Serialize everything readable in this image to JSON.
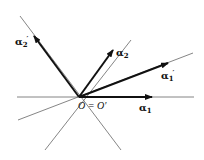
{
  "diagram": {
    "origin_label": "O = O′",
    "vectors": [
      {
        "name": "alpha1",
        "label": "α",
        "sub": "1",
        "prime": ""
      },
      {
        "name": "alpha2",
        "label": "α",
        "sub": "2",
        "prime": ""
      },
      {
        "name": "alpha1-prime",
        "label": "α",
        "sub": "1",
        "prime": "′"
      },
      {
        "name": "alpha2-prime",
        "label": "α",
        "sub": "2",
        "prime": "′"
      }
    ],
    "colors": {
      "ink": "#111111",
      "line": "#555555",
      "background": "#ffffff"
    }
  }
}
